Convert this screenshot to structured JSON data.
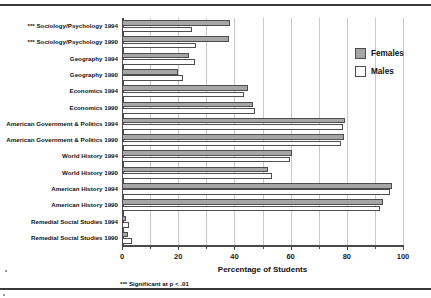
{
  "chart_data": {
    "type": "bar",
    "orientation": "horizontal",
    "title": "",
    "xlabel": "Percentage of Students",
    "ylabel": "",
    "xlim": [
      0,
      100
    ],
    "xticks": [
      0,
      20,
      40,
      60,
      80,
      100
    ],
    "xtick_labels": [
      "0",
      "20",
      "40",
      "60",
      "80",
      "100"
    ],
    "minor_tick_step": 10,
    "grid": "vertical gridlines every 10 units",
    "legend_position": "upper right, outside plot",
    "categories": [
      "*** Sociology/Psychology 1994",
      "*** Sociology/Psychology 1990",
      "Geography 1994",
      "Geography 1990",
      "Economics 1994",
      "Economics 1990",
      "American Government & Politics 1994",
      "American Government & Politics 1990",
      "World History 1994",
      "World History 1990",
      "American History 1994",
      "American History 1990",
      "Remedial Social Studies 1994",
      "Remedial Social Studies 1990"
    ],
    "series": [
      {
        "name": "Females",
        "color": "#a6a6a6",
        "values": [
          38.4,
          38.0,
          23.8,
          20.0,
          45.0,
          46.6,
          79.4,
          79.0,
          60.5,
          52.0,
          96.0,
          92.8,
          1.5,
          2.0
        ]
      },
      {
        "name": "Males",
        "color": "#ffffff",
        "values": [
          25.0,
          26.5,
          26.0,
          21.7,
          43.4,
          47.3,
          78.6,
          78.0,
          59.8,
          53.4,
          95.4,
          91.8,
          2.5,
          3.5
        ]
      }
    ],
    "annotations": [
      "*** Significant at p < .01"
    ]
  },
  "legend": {
    "items": [
      {
        "label": "Females",
        "swatch": "gray"
      },
      {
        "label": "Males",
        "swatch": "white"
      }
    ]
  },
  "axis": {
    "x_title": "Percentage of Students"
  },
  "footnote": {
    "text": "*** Significant at p < .01"
  }
}
